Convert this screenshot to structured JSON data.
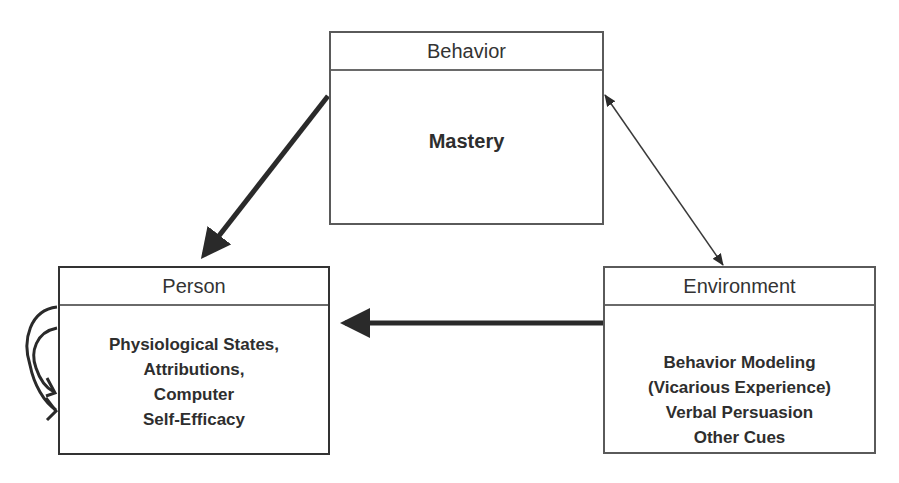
{
  "diagram": {
    "type": "triadic-reciprocal-causation",
    "nodes": {
      "behavior": {
        "title": "Behavior",
        "content": [
          "Mastery"
        ]
      },
      "person": {
        "title": "Person",
        "content": [
          "Physiological States,",
          "Attributions,",
          "Computer",
          "Self-Efficacy"
        ]
      },
      "environment": {
        "title": "Environment",
        "content": [
          "Behavior Modeling",
          "(Vicarious Experience)",
          "Verbal Persuasion",
          "Other Cues"
        ]
      }
    },
    "edges": [
      {
        "from": "behavior",
        "to": "person",
        "style": "thick",
        "direction": "one-way"
      },
      {
        "from": "environment",
        "to": "person",
        "style": "thick",
        "direction": "one-way"
      },
      {
        "from": "behavior",
        "to": "environment",
        "style": "thin",
        "direction": "two-way"
      },
      {
        "from": "person",
        "to": "person",
        "style": "curved-loop",
        "direction": "self"
      }
    ],
    "colors": {
      "border": "#5a5a5a",
      "text": "#2e2e2e",
      "arrow": "#2a2a2a",
      "background": "#ffffff"
    }
  }
}
